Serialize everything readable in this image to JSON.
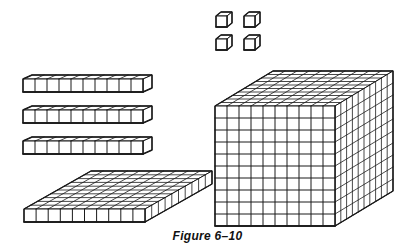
{
  "figure": {
    "caption": "Figure 6–10",
    "stroke_color": "#1a1a1a",
    "background": "#ffffff"
  },
  "blocks": {
    "units": {
      "count": 4,
      "items": [
        {
          "x": 216,
          "y": 16,
          "size": 11,
          "dx": 5,
          "dy": -4
        },
        {
          "x": 244,
          "y": 16,
          "size": 11,
          "dx": 5,
          "dy": -4
        },
        {
          "x": 216,
          "y": 39,
          "size": 11,
          "dx": 5,
          "dy": -4
        },
        {
          "x": 244,
          "y": 39,
          "size": 11,
          "dx": 5,
          "dy": -4
        }
      ]
    },
    "rods": {
      "count": 3,
      "cubes_per_rod": 10,
      "items": [
        {
          "x": 23,
          "y": 79,
          "w": 120,
          "h": 13,
          "dx": 9,
          "dy": -4
        },
        {
          "x": 23,
          "y": 110,
          "w": 120,
          "h": 13,
          "dx": 9,
          "dy": -4
        },
        {
          "x": 23,
          "y": 141,
          "w": 120,
          "h": 13,
          "dx": 9,
          "dy": -4
        }
      ]
    },
    "flat": {
      "count": 1,
      "grid": [
        10,
        10
      ],
      "x": 24,
      "y": 209,
      "w": 121,
      "h": 13,
      "dx": 67,
      "dy": -38
    },
    "cube": {
      "count": 1,
      "grid": [
        10,
        10,
        10
      ],
      "x": 215,
      "y": 106,
      "w": 120,
      "h": 120,
      "dx": 58,
      "dy": -35
    }
  }
}
